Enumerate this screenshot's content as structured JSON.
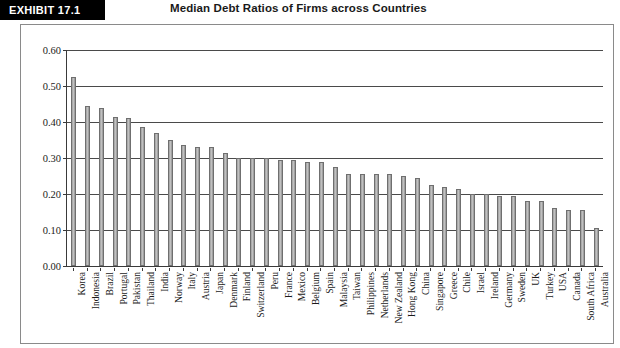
{
  "exhibit": {
    "tag": "EXHIBIT 17.1",
    "title": "Median Debt Ratios of Firms across Countries"
  },
  "chart_data": {
    "type": "bar",
    "title": "Median Debt Ratios of Firms across Countries",
    "xlabel": "",
    "ylabel": "",
    "ylim": [
      0.0,
      0.6
    ],
    "ytick_labels": [
      "0.00",
      "0.10",
      "0.20",
      "0.30",
      "0.40",
      "0.50",
      "0.60"
    ],
    "ytick_values": [
      0.0,
      0.1,
      0.2,
      0.3,
      0.4,
      0.5,
      0.6
    ],
    "grid": true,
    "legend": false,
    "bar_color": "#b4b4b4",
    "bar_border_color": "#6f6f6f",
    "categories": [
      "Korea",
      "Indonesia",
      "Brazil",
      "Portugal",
      "Pakistan",
      "Thailand",
      "India",
      "Norway",
      "Italy",
      "Austria",
      "Japan",
      "Denmark",
      "Finland",
      "Switzerland",
      "Peru",
      "France",
      "Mexico",
      "Belgium",
      "Spain",
      "Malaysia",
      "Taiwan",
      "Philippines",
      "Netherlands",
      "New Zealand",
      "Hong Kong",
      "China",
      "Singapore",
      "Greece",
      "Chile",
      "Israel",
      "Ireland",
      "Germany",
      "Sweden",
      "UK",
      "Turkey",
      "USA",
      "Canada",
      "South Africa",
      "Australia"
    ],
    "values": [
      0.525,
      0.445,
      0.44,
      0.415,
      0.41,
      0.385,
      0.37,
      0.35,
      0.335,
      0.33,
      0.33,
      0.315,
      0.3,
      0.3,
      0.3,
      0.295,
      0.295,
      0.29,
      0.29,
      0.275,
      0.255,
      0.255,
      0.255,
      0.255,
      0.25,
      0.245,
      0.225,
      0.22,
      0.215,
      0.2,
      0.2,
      0.195,
      0.195,
      0.18,
      0.18,
      0.16,
      0.155,
      0.155,
      0.105
    ]
  }
}
